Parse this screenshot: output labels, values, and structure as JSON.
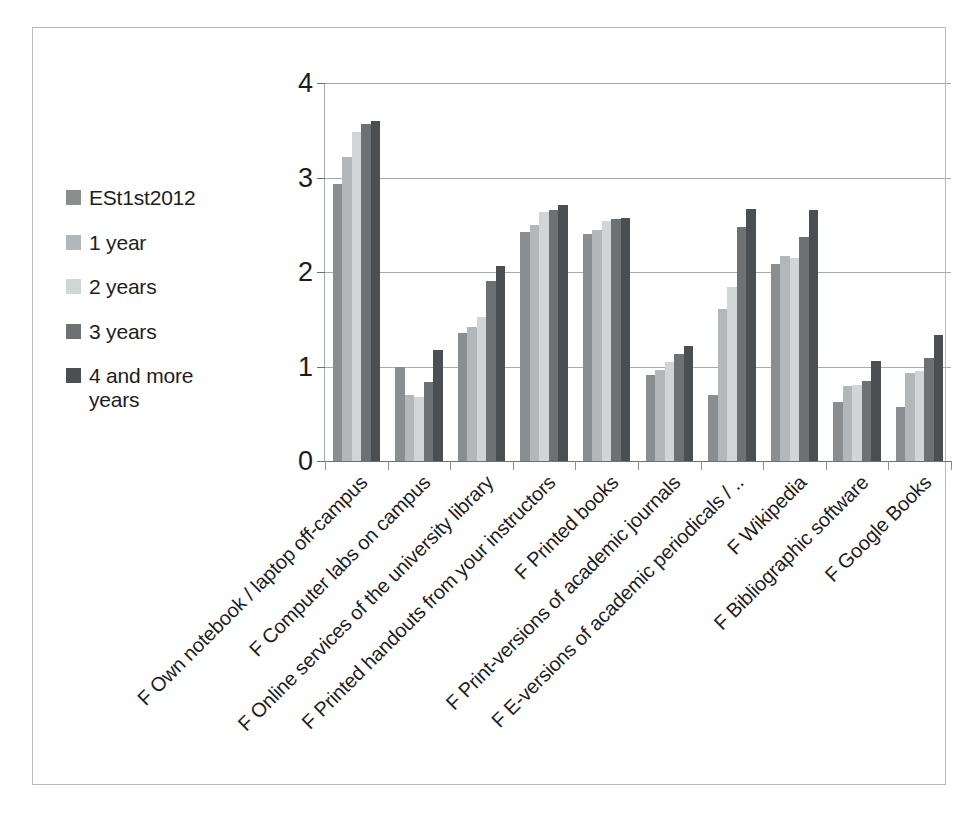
{
  "chart_data": {
    "type": "bar",
    "title": "",
    "subtitle": "",
    "xlabel": "",
    "ylabel": "",
    "ylim": [
      0,
      4
    ],
    "yticks": [
      "0",
      "1",
      "2",
      "3",
      "4"
    ],
    "grid": true,
    "legend_position": "left",
    "orientation": "vertical",
    "grouping": "grouped",
    "categories": [
      "F Own notebook / laptop off-campus",
      "F Computer labs on campus",
      "F Online services of the university library",
      "F Printed handouts from your instructors",
      "F Printed books",
      "F Print-versions of academic journals",
      "F E-versions of academic periodicals / ..",
      "F Wikipedia",
      "F Bibliographic software",
      "F Google Books"
    ],
    "series": [
      {
        "name": "ESt1st2012",
        "color": "#8b8e90",
        "values": [
          2.93,
          1.0,
          1.35,
          2.42,
          2.4,
          0.91,
          0.7,
          2.08,
          0.62,
          0.57
        ]
      },
      {
        "name": "1 year",
        "color": "#b4b7b9",
        "values": [
          3.22,
          0.7,
          1.42,
          2.5,
          2.44,
          0.96,
          1.61,
          2.17,
          0.79,
          0.93
        ]
      },
      {
        "name": "2 years",
        "color": "#d2d5d6",
        "values": [
          3.48,
          0.68,
          1.52,
          2.64,
          2.54,
          1.05,
          1.84,
          2.15,
          0.8,
          0.95
        ]
      },
      {
        "name": "3 years",
        "color": "#6e7173",
        "values": [
          3.57,
          0.84,
          1.9,
          2.66,
          2.56,
          1.13,
          2.48,
          2.37,
          0.85,
          1.09
        ]
      },
      {
        "name": "4 and more years",
        "color": "#4c4f51",
        "values": [
          3.6,
          1.18,
          2.06,
          2.71,
          2.57,
          1.22,
          2.67,
          2.66,
          1.06,
          1.33
        ]
      }
    ]
  },
  "legend": {
    "items": [
      {
        "label": "ESt1st2012",
        "color": "#8b8e90"
      },
      {
        "label": "1 year",
        "color": "#b4b7b9"
      },
      {
        "label": "2 years",
        "color": "#d2d5d6"
      },
      {
        "label": "3 years",
        "color": "#6e7173"
      },
      {
        "label": "4 and more years",
        "color": "#4c4f51"
      }
    ]
  },
  "axis": {
    "y_ticks": [
      "4",
      "3",
      "2",
      "1",
      "0"
    ]
  }
}
